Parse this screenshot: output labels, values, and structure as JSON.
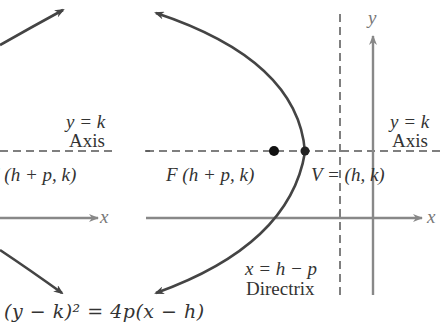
{
  "diagram": {
    "left_panel": {
      "axis_label_line1": "y = k",
      "axis_label_line2": "Axis",
      "focus_label": "F (h + p, k)",
      "x_axis_label": "x"
    },
    "right_panel": {
      "y_axis_label": "y",
      "axis_label_line1": "y = k",
      "axis_label_line2": "Axis",
      "focus_label": "F (h + p, k)",
      "vertex_label": "V = (h, k)",
      "x_axis_label": "x",
      "directrix_line1": "x = h − p",
      "directrix_line2": "Directrix"
    },
    "equation": "(y − k)² = 4p(x − h)",
    "colors": {
      "curve": "#444444",
      "axes": "#888888",
      "dashed": "#555555",
      "point": "#111111",
      "text": "#333333"
    }
  }
}
